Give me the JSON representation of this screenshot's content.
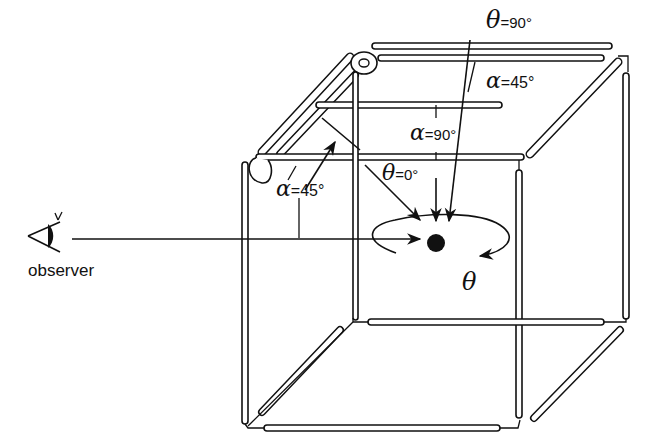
{
  "figure": {
    "observer_label": "observer",
    "labels": {
      "theta_top": {
        "symbol": "θ",
        "value": "=90°"
      },
      "alpha_top": {
        "symbol": "α",
        "value": "=45°"
      },
      "alpha_mid": {
        "symbol": "α",
        "value": "=90°"
      },
      "theta_front": {
        "symbol": "θ",
        "value": "=0°"
      },
      "alpha_left": {
        "symbol": "α",
        "value": "=45°"
      },
      "theta_rotation": {
        "symbol": "θ"
      }
    },
    "colors": {
      "ink": "#111111",
      "background": "#ffffff"
    }
  }
}
